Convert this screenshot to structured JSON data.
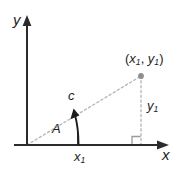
{
  "figure": {
    "type": "coordinate-geometry-diagram",
    "background_color": "#ffffff",
    "axis_color": "#2b2b2b",
    "dashed_color": "#b5b5b5",
    "arrow_color": "#1d1d1d",
    "point_color": "#8e8e8e",
    "axes": {
      "y_axis_label": "y",
      "x_axis_label": "x",
      "origin": {
        "x": 27,
        "y": 145
      },
      "x_axis_start": 14,
      "x_axis_end": 168,
      "y_axis_top": 18
    },
    "labels": {
      "point": {
        "open_paren": "(",
        "x_var": "x",
        "x_sub": "1",
        "comma": ", ",
        "y_var": "y",
        "y_sub": "1",
        "close_paren": ")"
      },
      "hypotenuse": "c",
      "angle": "A",
      "vertical_leg_var": "y",
      "vertical_leg_sub": "1",
      "horizontal_leg_var": "x",
      "horizontal_leg_sub": "1"
    },
    "geometry": {
      "point_x": 141,
      "point_y": 76,
      "tick_x": 78,
      "right_angle_marker": true,
      "angle_arrow": true
    }
  }
}
